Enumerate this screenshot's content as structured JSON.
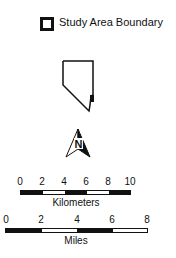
{
  "legend": {
    "label": "Study Area Boundary"
  },
  "map": {
    "north_arrow_letter": "N"
  },
  "scale_bars": {
    "kilometers": {
      "ticks": [
        "0",
        "2",
        "4",
        "6",
        "8",
        "10"
      ],
      "unit_label": "Kilometers"
    },
    "miles": {
      "ticks": [
        "0",
        "2",
        "4",
        "6",
        "8"
      ],
      "unit_label": "Miles"
    }
  },
  "colors": {
    "ink": "#111111",
    "background": "#ffffff"
  }
}
